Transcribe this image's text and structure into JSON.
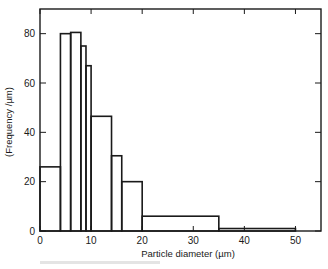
{
  "chart_data": {
    "type": "bar",
    "subtype": "histogram",
    "title": "",
    "xlabel": "Particle diameter (µm)",
    "ylabel": "(Frequency /µm)",
    "xlim": [
      0,
      55
    ],
    "ylim": [
      0,
      90
    ],
    "xticks": [
      0,
      10,
      20,
      30,
      40,
      50
    ],
    "yticks": [
      0,
      20,
      40,
      60,
      80
    ],
    "grid": false,
    "legend": null,
    "bins": [
      {
        "x0": 0,
        "x1": 4,
        "value": 26
      },
      {
        "x0": 4,
        "x1": 6,
        "value": 80
      },
      {
        "x0": 6,
        "x1": 8,
        "value": 80.5
      },
      {
        "x0": 8,
        "x1": 9,
        "value": 75
      },
      {
        "x0": 9,
        "x1": 10,
        "value": 67
      },
      {
        "x0": 10,
        "x1": 14,
        "value": 46.5
      },
      {
        "x0": 14,
        "x1": 16,
        "value": 30.5
      },
      {
        "x0": 16,
        "x1": 20,
        "value": 20
      },
      {
        "x0": 20,
        "x1": 35,
        "value": 6
      },
      {
        "x0": 35,
        "x1": 50,
        "value": 1
      }
    ],
    "categories": [
      "0-4",
      "4-6",
      "6-8",
      "8-9",
      "9-10",
      "10-14",
      "14-16",
      "16-20",
      "20-35",
      "35-50"
    ],
    "values": [
      26,
      80,
      80.5,
      75,
      67,
      46.5,
      30.5,
      20,
      6,
      1
    ]
  },
  "labels": {
    "xlabel": "Particle diameter (µm)",
    "ylabel": "(Frequency /µm)"
  }
}
